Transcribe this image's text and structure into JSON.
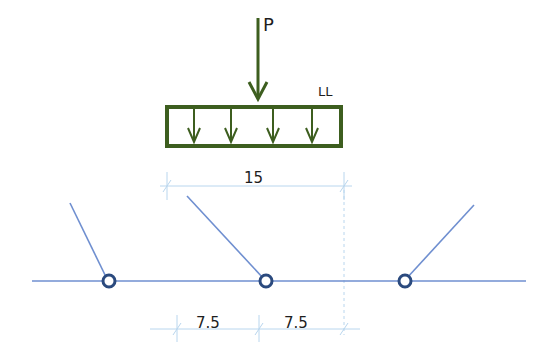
{
  "diagram": {
    "point_load_label": "P",
    "live_load_label": "LL",
    "load_width_dim": "15",
    "span_dims": [
      "7.5",
      "7.5"
    ],
    "colors": {
      "load": "#3d5e1f",
      "member": "#6f8fd0",
      "node": "#2b4a7e",
      "dimension": "#b9d6ee",
      "text": "#1e1e1e"
    },
    "nodes": [
      "left-pin",
      "middle-pin",
      "right-pin"
    ]
  }
}
